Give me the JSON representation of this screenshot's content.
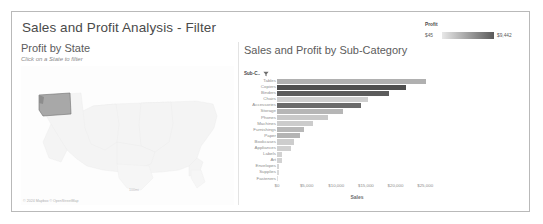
{
  "dashboard": {
    "title": "Sales and Profit Analysis - Filter"
  },
  "map_pane": {
    "title": "Profit by State",
    "subtitle": "Click on a State to filter",
    "attribution": "© 2024 Mapbox © OpenStreetMap",
    "scale_label": "100mi",
    "selected_state": "Washington"
  },
  "bar_pane": {
    "title": "Sales and Profit by Sub-Category",
    "column_header": "Sub-C..",
    "filter_icon": "filter-icon"
  },
  "legend": {
    "title": "Profit",
    "min_label": "$45",
    "max_label": "$9,442",
    "ramp_from": "#e8e8e8",
    "ramp_to": "#5a5a5a"
  },
  "chart_data": {
    "type": "bar",
    "orientation": "horizontal",
    "title": "Sales and Profit by Sub-Category",
    "xlabel": "Sales",
    "ylabel": "Sub-Category",
    "xlim": [
      0,
      27000
    ],
    "xticks": [
      0,
      5000,
      10000,
      15000,
      20000,
      25000
    ],
    "xticklabels": [
      "$0",
      "$5,000",
      "$10,000",
      "$15,000",
      "$20,000",
      "$25,000"
    ],
    "grid": false,
    "legend_position": "top-right",
    "color_metric": "Profit",
    "color_range": [
      45,
      9442
    ],
    "categories": [
      "Tables",
      "Copiers",
      "Binders",
      "Chairs",
      "Accessories",
      "Storage",
      "Phones",
      "Machines",
      "Furnishings",
      "Paper",
      "Bookcases",
      "Appliances",
      "Labels",
      "Art",
      "Envelopes",
      "Supplies",
      "Fasteners"
    ],
    "values": [
      25200,
      21700,
      18900,
      15400,
      14100,
      11200,
      8600,
      6100,
      4600,
      3900,
      2900,
      2300,
      900,
      850,
      400,
      300,
      200
    ],
    "profit": [
      4500,
      9442,
      8600,
      2200,
      7900,
      3100,
      1800,
      1300,
      2400,
      2900,
      900,
      700,
      500,
      450,
      300,
      120,
      45
    ],
    "bar_colors": [
      "#b0b0b0",
      "#4f4f4f",
      "#5c5c5c",
      "#cfcfcf",
      "#6b6b6b",
      "#b6b6b6",
      "#c9c9c9",
      "#cccccc",
      "#b8b8b8",
      "#b4b4b4",
      "#cdcdcd",
      "#d0d0d0",
      "#d2d2d2",
      "#d2d2d2",
      "#d6d6d6",
      "#dadada",
      "#e0e0e0"
    ]
  }
}
